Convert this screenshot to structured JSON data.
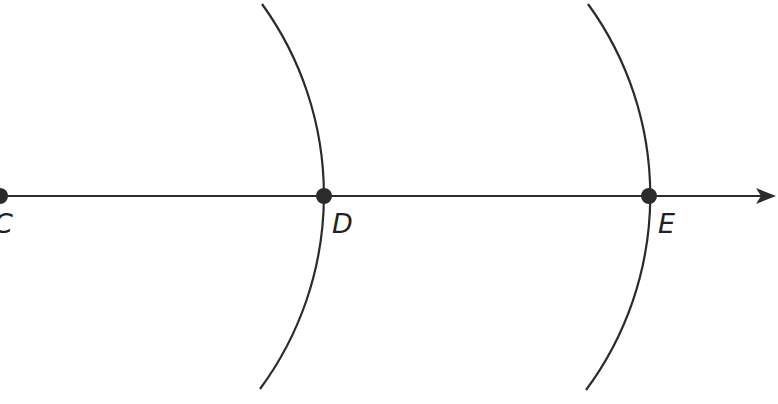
{
  "diagram": {
    "type": "geometric-construction",
    "stroke_color": "#2b2b2b",
    "points": [
      {
        "label": "C",
        "x": 0,
        "y": 196
      },
      {
        "label": "D",
        "x": 324,
        "y": 196
      },
      {
        "label": "E",
        "x": 649,
        "y": 196
      }
    ],
    "ray": {
      "from": "C",
      "through": [
        "D",
        "E"
      ],
      "arrow_tip_x": 775
    },
    "arcs": [
      {
        "center": "C",
        "radius_approx": 326,
        "passes_through": "D"
      },
      {
        "center": "D",
        "radius_approx": 326,
        "passes_through": "E"
      }
    ]
  }
}
